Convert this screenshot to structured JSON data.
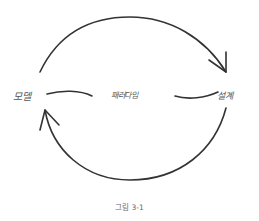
{
  "diagram": {
    "nodes": [
      {
        "id": "model",
        "label": "모델"
      },
      {
        "id": "paradigm",
        "label": "패러다임"
      },
      {
        "id": "design",
        "label": "설계"
      }
    ],
    "edges": [
      {
        "from": "model",
        "to": "design",
        "style": "curved-arrow-top"
      },
      {
        "from": "design",
        "to": "model",
        "style": "curved-arrow-bottom"
      }
    ],
    "caption": "그림 3-1",
    "colors": {
      "stroke": "#333333",
      "text": "#555555",
      "caption": "#666666",
      "background": "#ffffff"
    }
  }
}
